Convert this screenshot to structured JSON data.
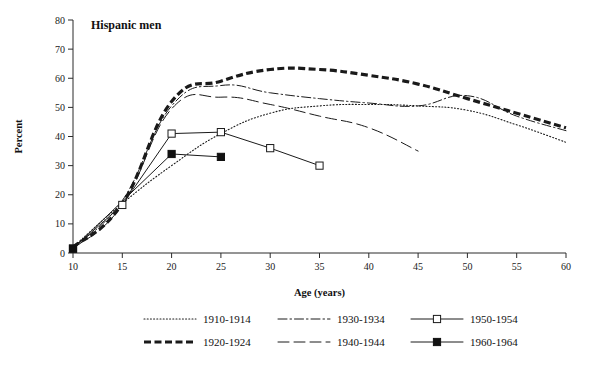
{
  "panel": {
    "title": "Hispanic men"
  },
  "axes": {
    "x_title": "Age (years)",
    "y_title": "Percent",
    "x_ticks": [
      "10",
      "15",
      "20",
      "25",
      "30",
      "35",
      "40",
      "45",
      "50",
      "55",
      "60"
    ],
    "y_ticks": [
      "0",
      "10",
      "20",
      "30",
      "40",
      "50",
      "60",
      "70",
      "80"
    ]
  },
  "legend": {
    "entries": [
      {
        "label": "1910-1914",
        "style": "dotted",
        "marker": "none"
      },
      {
        "label": "1920-1924",
        "style": "thick-dashed",
        "marker": "none"
      },
      {
        "label": "1930-1934",
        "style": "dash-dot",
        "marker": "none"
      },
      {
        "label": "1940-1944",
        "style": "long-dashed",
        "marker": "none"
      },
      {
        "label": "1950-1954",
        "style": "solid",
        "marker": "open-square"
      },
      {
        "label": "1960-1964",
        "style": "solid",
        "marker": "filled-square"
      }
    ]
  },
  "chart_data": {
    "type": "line",
    "title": "Hispanic men",
    "xlabel": "Age (years)",
    "ylabel": "Percent",
    "xlim": [
      10,
      60
    ],
    "ylim": [
      0,
      80
    ],
    "xticks": [
      10,
      15,
      20,
      25,
      30,
      35,
      40,
      45,
      50,
      55,
      60
    ],
    "yticks": [
      0,
      10,
      20,
      30,
      40,
      50,
      60,
      70,
      80
    ],
    "grid": false,
    "legend_position": "bottom",
    "series": [
      {
        "name": "1910-1914",
        "style": "dotted",
        "marker": "none",
        "x": [
          10,
          15,
          20,
          25,
          30,
          35,
          40,
          45,
          50,
          55,
          60
        ],
        "y": [
          2,
          17,
          30,
          41,
          48,
          50.5,
          51,
          50.5,
          49,
          44,
          38
        ]
      },
      {
        "name": "1920-1924",
        "style": "thick-dashed",
        "marker": "none",
        "x": [
          10,
          15,
          20,
          25,
          30,
          35,
          40,
          45,
          50,
          55,
          60
        ],
        "y": [
          2,
          17,
          52,
          59,
          63,
          63,
          61,
          58,
          53,
          48,
          43
        ]
      },
      {
        "name": "1930-1934",
        "style": "dash-dot",
        "marker": "none",
        "x": [
          10,
          15,
          20,
          25,
          30,
          35,
          40,
          45,
          50,
          55,
          60
        ],
        "y": [
          2,
          18,
          50.5,
          57.5,
          55,
          53,
          51.5,
          50.5,
          54,
          47,
          42
        ]
      },
      {
        "name": "1940-1944",
        "style": "long-dashed",
        "marker": "none",
        "x": [
          10,
          15,
          20,
          25,
          30,
          35,
          40,
          45
        ],
        "y": [
          1.5,
          16.5,
          49.5,
          53.5,
          51,
          47,
          43,
          35
        ]
      },
      {
        "name": "1950-1954",
        "style": "solid",
        "marker": "open-square",
        "x": [
          10,
          15,
          20,
          25,
          30,
          35
        ],
        "y": [
          1.5,
          16.5,
          41,
          41.5,
          36,
          30
        ]
      },
      {
        "name": "1960-1964",
        "style": "solid",
        "marker": "filled-square",
        "x": [
          10,
          20,
          25
        ],
        "y": [
          1.5,
          34,
          33
        ]
      }
    ]
  }
}
